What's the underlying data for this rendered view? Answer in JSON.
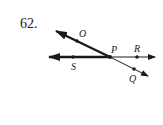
{
  "problem_number": "62.",
  "points": {
    "O": {
      "label": "O"
    },
    "P": {
      "label": "P"
    },
    "R": {
      "label": "R"
    },
    "S": {
      "label": "S"
    },
    "Q": {
      "label": "Q"
    }
  },
  "colors": {
    "ink": "#1a1a1a",
    "background": "#ffffff"
  }
}
